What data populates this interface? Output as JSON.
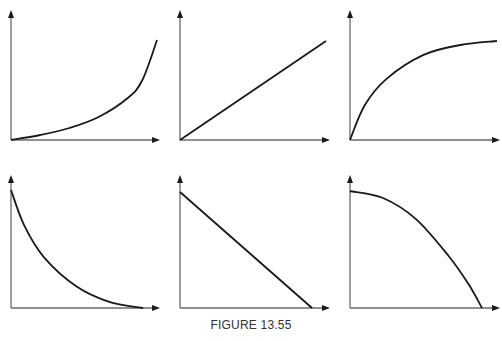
{
  "figure": {
    "caption": "FIGURE 13.55",
    "layout": "2 rows x 3 columns",
    "colors": {
      "curve": "#1a1a1a",
      "axis": "#6a6a6a",
      "background": "#ffffff"
    }
  },
  "chart_data": [
    {
      "type": "line",
      "title": "",
      "xlabel": "",
      "ylabel": "",
      "description": "increasing, concave up (accelerating growth)",
      "x": [
        0,
        0.2,
        0.4,
        0.6,
        0.8,
        0.9,
        1.0
      ],
      "y": [
        0,
        0.05,
        0.12,
        0.23,
        0.42,
        0.6,
        1.0
      ]
    },
    {
      "type": "line",
      "title": "",
      "xlabel": "",
      "ylabel": "",
      "description": "increasing, linear (direct proportion)",
      "x": [
        0,
        1
      ],
      "y": [
        0,
        1
      ]
    },
    {
      "type": "line",
      "title": "",
      "xlabel": "",
      "ylabel": "",
      "description": "increasing, concave down (leveling off)",
      "x": [
        0,
        0.1,
        0.25,
        0.5,
        0.75,
        1.0
      ],
      "y": [
        0,
        0.35,
        0.62,
        0.86,
        0.96,
        1.0
      ]
    },
    {
      "type": "line",
      "title": "",
      "xlabel": "",
      "ylabel": "",
      "description": "decreasing, concave up (inverse / decay)",
      "x": [
        0,
        0.1,
        0.25,
        0.5,
        0.75,
        1.0
      ],
      "y": [
        1.0,
        0.7,
        0.43,
        0.18,
        0.05,
        0
      ]
    },
    {
      "type": "line",
      "title": "",
      "xlabel": "",
      "ylabel": "",
      "description": "decreasing, linear",
      "x": [
        0,
        1
      ],
      "y": [
        1,
        0
      ]
    },
    {
      "type": "line",
      "title": "",
      "xlabel": "",
      "ylabel": "",
      "description": "decreasing, concave down (accelerating decline)",
      "x": [
        0,
        0.25,
        0.5,
        0.75,
        0.9,
        1.0
      ],
      "y": [
        1.0,
        0.94,
        0.76,
        0.44,
        0.2,
        0
      ]
    }
  ]
}
